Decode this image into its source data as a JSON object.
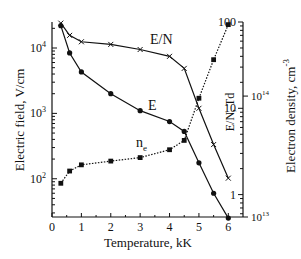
{
  "chart_data": {
    "type": "line",
    "title": "",
    "xlabel": "Temperature,  kK",
    "ylabel_left": "Electric field,  V/cm",
    "ylabel_right_outer": "Electron density,  cm",
    "ylabel_right_outer_sup": "-3",
    "ylabel_right_inner": "E/N, Td",
    "xlim": [
      0,
      6.5
    ],
    "ylim_left": [
      26,
      25000
    ],
    "ylim_right_en": [
      0.55,
      100
    ],
    "ylim_right_ne": [
      10000000000000.0,
      410000000000000.0
    ],
    "x_ticks": [
      "0",
      "1",
      "2",
      "3",
      "4",
      "5",
      "6"
    ],
    "left_ticks": [
      {
        "base": "10",
        "exp": "2",
        "value": 100
      },
      {
        "base": "10",
        "exp": "3",
        "value": 1000
      },
      {
        "base": "10",
        "exp": "4",
        "value": 10000
      }
    ],
    "right_en_ticks": [
      {
        "label": "1",
        "value": 1
      },
      {
        "label": "10",
        "value": 10
      },
      {
        "label": "100",
        "value": 100
      }
    ],
    "right_ne_ticks": [
      {
        "base": "10",
        "exp": "13",
        "value": 10000000000000.0
      },
      {
        "base": "10",
        "exp": "14",
        "value": 100000000000000.0
      }
    ],
    "x": [
      0.3,
      0.6,
      1,
      2,
      3,
      4,
      4.5,
      5,
      5.5,
      6
    ],
    "series": [
      {
        "name": "E",
        "label": "E",
        "axis": "left",
        "marker": "circle",
        "style": "solid",
        "values": [
          22000,
          8400,
          4300,
          2000,
          1100,
          750,
          530,
          175,
          60,
          25
        ]
      },
      {
        "name": "E/N",
        "label": "E/N",
        "axis": "right_en",
        "marker": "x",
        "style": "solid",
        "values": [
          97,
          70,
          59,
          55,
          48,
          40,
          29,
          10,
          3.8,
          1.55
        ]
      },
      {
        "name": "n_e",
        "label": "n",
        "label_sub": "e",
        "axis": "right_ne",
        "marker": "square",
        "style": "dotted",
        "values": [
          19000000000000.0,
          24000000000000.0,
          27000000000000.0,
          29000000000000.0,
          31000000000000.0,
          36000000000000.0,
          43000000000000.0,
          96000000000000.0,
          200000000000000.0,
          390000000000000.0
        ]
      }
    ],
    "grid": false,
    "legend": "inline labels"
  }
}
